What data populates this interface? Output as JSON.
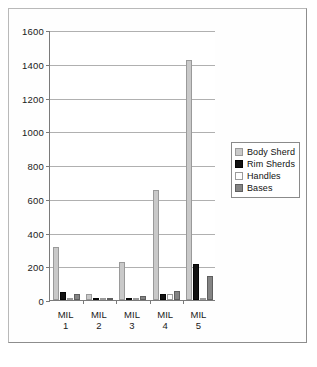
{
  "chart_data": {
    "type": "bar",
    "title": "",
    "subtitle": "",
    "xlabel": "",
    "ylabel": "",
    "categories": [
      "MIL 1",
      "MIL 2",
      "MIL 3",
      "MIL 4",
      "MIL 5"
    ],
    "category_lines": [
      [
        "MIL",
        "1"
      ],
      [
        "MIL",
        "2"
      ],
      [
        "MIL",
        "3"
      ],
      [
        "MIL",
        "4"
      ],
      [
        "MIL",
        "5"
      ]
    ],
    "series": [
      {
        "name": "Body Sherd",
        "color": "#c9c9c9",
        "values": [
          315,
          38,
          228,
          650,
          1420
        ]
      },
      {
        "name": "Rim Sherds",
        "color": "#121212",
        "values": [
          48,
          8,
          8,
          34,
          213
        ]
      },
      {
        "name": "Handles",
        "color": "#fdfdfd",
        "values": [
          5,
          4,
          5,
          38,
          8
        ]
      },
      {
        "name": "Bases",
        "color": "#848484",
        "values": [
          36,
          4,
          22,
          52,
          140
        ]
      }
    ],
    "ylim": [
      0,
      1600
    ],
    "ytick_step": 200,
    "yticks": [
      0,
      200,
      400,
      600,
      800,
      1000,
      1200,
      1400,
      1600
    ],
    "ytick_labels": [
      "0",
      "200",
      "400",
      "600",
      "800",
      "1000",
      "1200",
      "1400",
      "1600"
    ],
    "grid": true,
    "grid_axis": "y",
    "legend_position": "right"
  },
  "legend": {
    "entries": [
      {
        "label": "Body Sherd",
        "swatch": "body"
      },
      {
        "label": "Rim Sherds",
        "swatch": "rim"
      },
      {
        "label": "Handles",
        "swatch": "handle"
      },
      {
        "label": "Bases",
        "swatch": "base"
      }
    ]
  },
  "caption": {
    "remnant": ""
  }
}
